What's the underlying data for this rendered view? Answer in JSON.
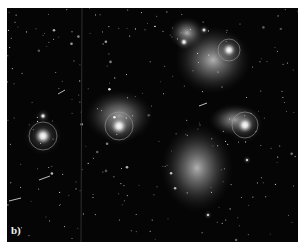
{
  "figure": {
    "panel_label": "b)",
    "background_color": "#050505",
    "border_color": "#ffffff"
  }
}
